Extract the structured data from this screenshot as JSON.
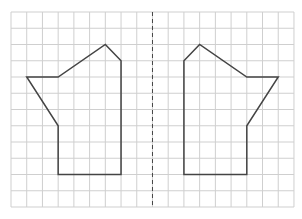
{
  "figure": {
    "type": "symmetry-grid",
    "grid": {
      "columns": 18,
      "rows": 12,
      "origin_x": 11,
      "origin_y": 12,
      "cell_width": 15.72,
      "cell_height": 16.25,
      "line_color": "#cfcfcf"
    },
    "axis_of_symmetry": {
      "column": 9,
      "style": "dashed",
      "color": "#444444"
    },
    "shapes": [
      {
        "name": "left-shape",
        "stroke": "#444444",
        "vertices": [
          [
            1,
            4
          ],
          [
            3,
            4
          ],
          [
            6,
            2
          ],
          [
            7,
            3
          ],
          [
            7,
            10
          ],
          [
            3,
            10
          ],
          [
            3,
            7
          ]
        ]
      },
      {
        "name": "right-shape",
        "stroke": "#444444",
        "vertices": [
          [
            17,
            4
          ],
          [
            15,
            4
          ],
          [
            12,
            2
          ],
          [
            11,
            3
          ],
          [
            11,
            10
          ],
          [
            15,
            10
          ],
          [
            15,
            7
          ]
        ]
      }
    ]
  }
}
